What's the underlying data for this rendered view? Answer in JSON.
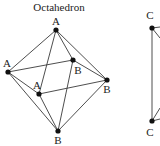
{
  "octahedron": {
    "title": "Octahedron",
    "vertices": [
      {
        "id": "top",
        "label": "A",
        "x": 56,
        "y": 30,
        "lx": 56,
        "ly": 25
      },
      {
        "id": "left",
        "label": "A",
        "x": 8,
        "y": 72,
        "lx": 7,
        "ly": 67
      },
      {
        "id": "back",
        "label": "B",
        "x": 73,
        "y": 60,
        "lx": 78,
        "ly": 74
      },
      {
        "id": "front",
        "label": "A",
        "x": 39,
        "y": 94,
        "lx": 37,
        "ly": 89
      },
      {
        "id": "right",
        "label": "B",
        "x": 107,
        "y": 80,
        "lx": 107,
        "ly": 93
      },
      {
        "id": "bottom",
        "label": "B",
        "x": 58,
        "y": 131,
        "lx": 58,
        "ly": 144
      }
    ]
  },
  "second_figure": {
    "top_label": "C",
    "bottom_label": "C"
  }
}
